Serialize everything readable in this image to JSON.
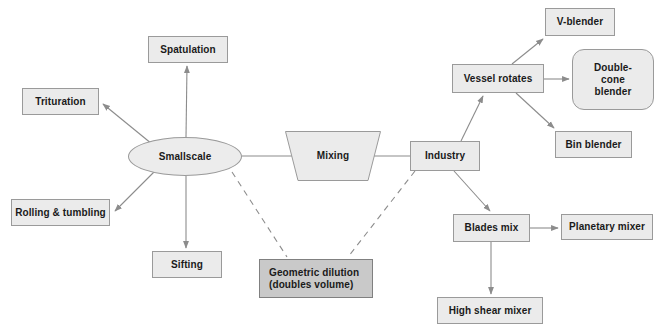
{
  "diagram": {
    "colors": {
      "node_fill": "#ebebeb",
      "node_fill_dark": "#c9c9c9",
      "node_border": "#9a9a9a",
      "edge": "#8c8c8c",
      "text": "#1a1a1a",
      "background": "#ffffff"
    },
    "nodes": [
      {
        "id": "spatulation",
        "label": "Spatulation",
        "shape": "rect",
        "x": 148,
        "y": 36,
        "w": 80,
        "h": 27
      },
      {
        "id": "trituration",
        "label": "Trituration",
        "shape": "rect",
        "x": 22,
        "y": 88,
        "w": 77,
        "h": 27
      },
      {
        "id": "smallscale",
        "label": "Smallscale",
        "shape": "ellipse",
        "x": 128,
        "y": 137,
        "w": 114,
        "h": 39
      },
      {
        "id": "rolling-tumbling",
        "label": "Rolling & tumbling",
        "shape": "rect",
        "x": 11,
        "y": 199,
        "w": 99,
        "h": 27
      },
      {
        "id": "sifting",
        "label": "Sifting",
        "shape": "rect",
        "x": 152,
        "y": 251,
        "w": 70,
        "h": 27
      },
      {
        "id": "mixing",
        "label": "Mixing",
        "shape": "trapezoid",
        "x": 285,
        "y": 131,
        "w": 96,
        "h": 50
      },
      {
        "id": "geometric-dilution",
        "label": "Geometric dilution\n(doubles volume)",
        "shape": "rect-dark",
        "x": 259,
        "y": 259,
        "w": 114,
        "h": 39
      },
      {
        "id": "industry",
        "label": "Industry",
        "shape": "rect",
        "x": 410,
        "y": 141,
        "w": 70,
        "h": 30
      },
      {
        "id": "vessel-rotates",
        "label": "Vessel rotates",
        "shape": "rect",
        "x": 452,
        "y": 64,
        "w": 92,
        "h": 29
      },
      {
        "id": "v-blender",
        "label": "V-blender",
        "shape": "rect",
        "x": 545,
        "y": 8,
        "w": 70,
        "h": 28
      },
      {
        "id": "double-cone-blender",
        "label": "Double-\ncone\nblender",
        "shape": "rounded-rect",
        "x": 572,
        "y": 49,
        "w": 82,
        "h": 61
      },
      {
        "id": "bin-blender",
        "label": "Bin blender",
        "shape": "rect",
        "x": 555,
        "y": 131,
        "w": 77,
        "h": 27
      },
      {
        "id": "blades-mix",
        "label": "Blades mix",
        "shape": "rect",
        "x": 453,
        "y": 214,
        "w": 77,
        "h": 28
      },
      {
        "id": "planetary-mixer",
        "label": "Planetary mixer",
        "shape": "rect",
        "x": 561,
        "y": 214,
        "w": 92,
        "h": 26
      },
      {
        "id": "high-shear-mixer",
        "label": "High shear mixer",
        "shape": "rect",
        "x": 437,
        "y": 297,
        "w": 106,
        "h": 27
      }
    ],
    "edges": [
      {
        "id": "smallscale-to-spatulation",
        "from": "smallscale",
        "to": "spatulation",
        "style": "solid",
        "arrow": true
      },
      {
        "id": "smallscale-to-trituration",
        "from": "smallscale",
        "to": "trituration",
        "style": "solid",
        "arrow": true
      },
      {
        "id": "smallscale-to-rolling-tumbling",
        "from": "smallscale",
        "to": "rolling-tumbling",
        "style": "solid",
        "arrow": true
      },
      {
        "id": "smallscale-to-sifting",
        "from": "smallscale",
        "to": "sifting",
        "style": "solid",
        "arrow": true
      },
      {
        "id": "smallscale-to-mixing",
        "from": "smallscale",
        "to": "mixing",
        "style": "solid",
        "arrow": false
      },
      {
        "id": "smallscale-to-geometric-dilution",
        "from": "smallscale",
        "to": "geometric-dilution",
        "style": "dashed",
        "arrow": false
      },
      {
        "id": "mixing-to-industry",
        "from": "mixing",
        "to": "industry",
        "style": "solid",
        "arrow": false
      },
      {
        "id": "industry-to-geometric-dilution",
        "from": "industry",
        "to": "geometric-dilution",
        "style": "dashed",
        "arrow": false
      },
      {
        "id": "industry-to-vessel-rotates",
        "from": "industry",
        "to": "vessel-rotates",
        "style": "solid",
        "arrow": true
      },
      {
        "id": "industry-to-blades-mix",
        "from": "industry",
        "to": "blades-mix",
        "style": "solid",
        "arrow": true
      },
      {
        "id": "vessel-rotates-to-v-blender",
        "from": "vessel-rotates",
        "to": "v-blender",
        "style": "solid",
        "arrow": true
      },
      {
        "id": "vessel-rotates-to-double-cone-blender",
        "from": "vessel-rotates",
        "to": "double-cone-blender",
        "style": "solid",
        "arrow": true
      },
      {
        "id": "vessel-rotates-to-bin-blender",
        "from": "vessel-rotates",
        "to": "bin-blender",
        "style": "solid",
        "arrow": true
      },
      {
        "id": "blades-mix-to-planetary-mixer",
        "from": "blades-mix",
        "to": "planetary-mixer",
        "style": "solid",
        "arrow": true
      },
      {
        "id": "blades-mix-to-high-shear-mixer",
        "from": "blades-mix",
        "to": "high-shear-mixer",
        "style": "solid",
        "arrow": true
      }
    ]
  }
}
